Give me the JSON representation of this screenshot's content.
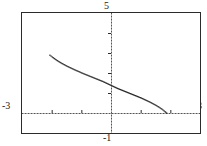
{
  "window": {
    "xmin_label": "-3",
    "xmax_label": "3",
    "ymax_label": "5",
    "ymin_label": "-1"
  },
  "chart_data": {
    "type": "line",
    "title": "",
    "xlabel": "",
    "ylabel": "",
    "xlim": [
      -3,
      3
    ],
    "ylim": [
      -1,
      5
    ],
    "grid": false,
    "legend": null,
    "axes": {
      "style": "dotted",
      "x_axis_at_y": 0,
      "y_axis_at_x": 0,
      "x_tick_spacing": 1,
      "y_tick_spacing": 1,
      "x_ticks": [
        -2,
        -1,
        1,
        2
      ],
      "y_ticks": [
        1,
        2,
        3,
        4
      ]
    },
    "series": [
      {
        "name": "curve",
        "style": "dotted",
        "color": "#2b2b2b",
        "x": [
          -2.08,
          -2.0,
          -1.9,
          -1.8,
          -1.7,
          -1.6,
          -1.5,
          -1.4,
          -1.3,
          -1.2,
          -1.1,
          -1.0,
          -0.9,
          -0.8,
          -0.7,
          -0.6,
          -0.5,
          -0.4,
          -0.3,
          -0.2,
          -0.1,
          0.0,
          0.1,
          0.2,
          0.3,
          0.4,
          0.5,
          0.6,
          0.7,
          0.8,
          0.9,
          1.0,
          1.1,
          1.2,
          1.3,
          1.4,
          1.5,
          1.6,
          1.7,
          1.8,
          1.86,
          1.9
        ],
        "y": [
          2.92,
          2.83,
          2.72,
          2.62,
          2.53,
          2.45,
          2.37,
          2.3,
          2.23,
          2.16,
          2.1,
          2.03,
          1.97,
          1.91,
          1.85,
          1.79,
          1.73,
          1.67,
          1.61,
          1.54,
          1.47,
          1.4,
          1.33,
          1.26,
          1.2,
          1.14,
          1.08,
          1.02,
          0.96,
          0.9,
          0.84,
          0.78,
          0.71,
          0.64,
          0.57,
          0.49,
          0.41,
          0.32,
          0.22,
          0.1,
          0.02,
          0.0
        ]
      }
    ]
  }
}
